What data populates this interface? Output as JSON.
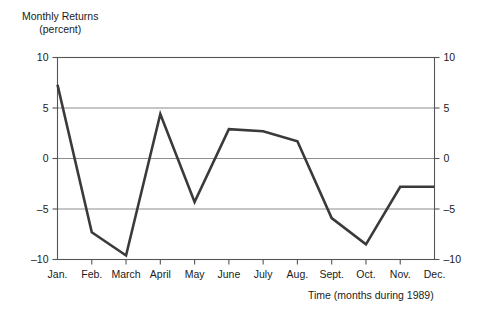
{
  "chart_data": {
    "type": "line",
    "title": "",
    "ylabel_line1": "Monthly Returns",
    "ylabel_line2": "(percent)",
    "xlabel": "Time (months during 1989)",
    "categories": [
      "Jan.",
      "Feb.",
      "March",
      "April",
      "May",
      "June",
      "July",
      "Aug.",
      "Sept.",
      "Oct.",
      "Nov.",
      "Dec."
    ],
    "values": [
      7.3,
      -7.3,
      -9.6,
      4.4,
      -4.3,
      2.9,
      2.7,
      1.7,
      -5.9,
      -8.5,
      -2.8,
      -2.8
    ],
    "ylim": [
      -10,
      10
    ],
    "yticks": [
      10,
      5,
      0,
      -5,
      -10
    ],
    "ytick_labels_left": [
      "10",
      "5",
      "0",
      "-5",
      "-10"
    ],
    "ytick_labels_right": [
      "10",
      "5",
      "0",
      "-5",
      "-10"
    ],
    "grid": true,
    "grid_axis": "y",
    "legend": "none",
    "series_color": "#3a3a3a",
    "grid_color": "#808080",
    "axis_color": "#555555",
    "background": "#ffffff"
  }
}
